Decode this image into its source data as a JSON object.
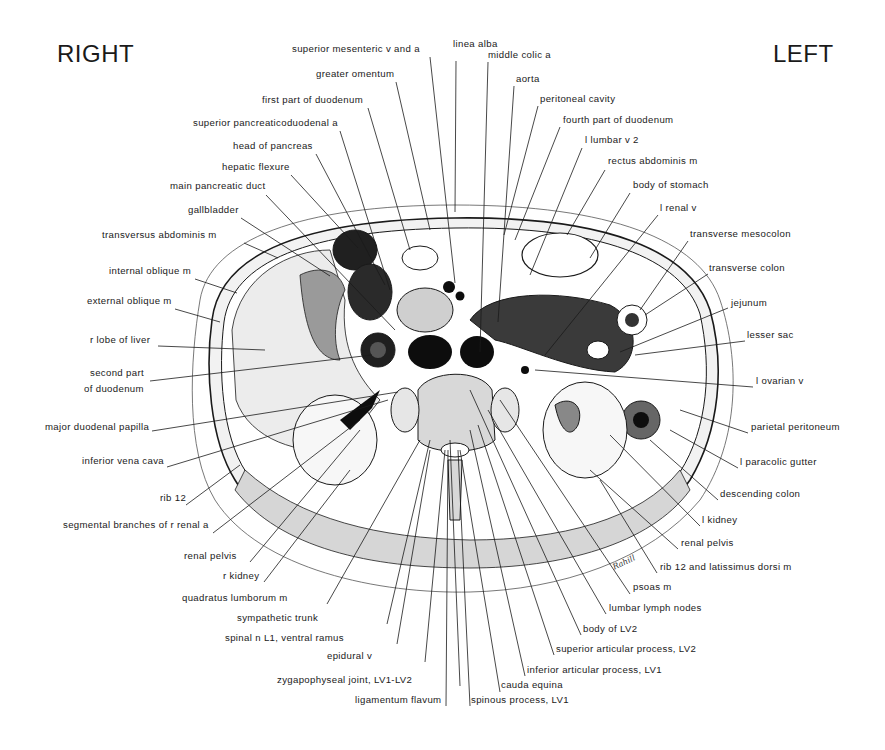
{
  "orientation": {
    "right": "RIGHT",
    "left": "LEFT"
  },
  "signature": "Rahill",
  "labels": {
    "top": [
      {
        "id": "superior-mesenteric-v-and-a",
        "text": "superior mesenteric v and a",
        "x": 292,
        "y": 51
      },
      {
        "id": "greater-omentum",
        "text": "greater omentum",
        "x": 316,
        "y": 76
      },
      {
        "id": "first-part-of-duodenum",
        "text": "first part of duodenum",
        "x": 262,
        "y": 102
      },
      {
        "id": "superior-pancreaticoduodenal-a",
        "text": "superior pancreaticoduodenal a",
        "x": 193,
        "y": 125
      },
      {
        "id": "head-of-pancreas",
        "text": "head of pancreas",
        "x": 233,
        "y": 148
      },
      {
        "id": "hepatic-flexure",
        "text": "hepatic flexure",
        "x": 222,
        "y": 169
      },
      {
        "id": "main-pancreatic-duct",
        "text": "main pancreatic duct",
        "x": 170,
        "y": 188
      },
      {
        "id": "gallbladder",
        "text": "gallbladder",
        "x": 188,
        "y": 212
      },
      {
        "id": "linea-alba",
        "text": "linea alba",
        "x": 453,
        "y": 46
      },
      {
        "id": "middle-colic-a",
        "text": "middle colic a",
        "x": 488,
        "y": 57
      },
      {
        "id": "aorta",
        "text": "aorta",
        "x": 516,
        "y": 81
      },
      {
        "id": "peritoneal-cavity",
        "text": "peritoneal cavity",
        "x": 540,
        "y": 101
      },
      {
        "id": "fourth-part-of-duodenum",
        "text": "fourth part of duodenum",
        "x": 563,
        "y": 122
      },
      {
        "id": "l-lumbar-v-2",
        "text": "l lumbar v 2",
        "x": 585,
        "y": 142
      },
      {
        "id": "rectus-abdominis-m",
        "text": "rectus abdominis m",
        "x": 608,
        "y": 163
      },
      {
        "id": "body-of-stomach",
        "text": "body of stomach",
        "x": 633,
        "y": 187
      },
      {
        "id": "l-renal-v",
        "text": "l renal v",
        "x": 660,
        "y": 210
      }
    ],
    "left_side": [
      {
        "id": "transversus-abdominis-m",
        "text": "transversus abdominis m",
        "x": 102,
        "y": 237
      },
      {
        "id": "internal-oblique-m",
        "text": "internal oblique m",
        "x": 109,
        "y": 273
      },
      {
        "id": "external-oblique-m",
        "text": "external oblique m",
        "x": 87,
        "y": 303
      },
      {
        "id": "r-lobe-of-liver",
        "text": "r lobe of liver",
        "x": 90,
        "y": 342
      },
      {
        "id": "second-part-of-duodenum-1",
        "text": "second part",
        "x": 90,
        "y": 375
      },
      {
        "id": "second-part-of-duodenum-2",
        "text": "of duodenum",
        "x": 84,
        "y": 391
      },
      {
        "id": "major-duodenal-papilla",
        "text": "major duodenal papilla",
        "x": 45,
        "y": 429
      },
      {
        "id": "inferior-vena-cava",
        "text": "inferior vena cava",
        "x": 82,
        "y": 463
      },
      {
        "id": "rib-12",
        "text": "rib 12",
        "x": 160,
        "y": 500
      },
      {
        "id": "segmental-branches-of-r-renal-a",
        "text": "segmental branches of r renal a",
        "x": 63,
        "y": 527
      }
    ],
    "right_side": [
      {
        "id": "transverse-mesocolon",
        "text": "transverse mesocolon",
        "x": 690,
        "y": 236
      },
      {
        "id": "transverse-colon",
        "text": "transverse colon",
        "x": 709,
        "y": 270
      },
      {
        "id": "jejunum",
        "text": "jejunum",
        "x": 731,
        "y": 305
      },
      {
        "id": "lesser-sac",
        "text": "lesser sac",
        "x": 747,
        "y": 337
      },
      {
        "id": "l-ovarian-v",
        "text": "l ovarian v",
        "x": 756,
        "y": 383
      },
      {
        "id": "parietal-peritoneum",
        "text": "parietal peritoneum",
        "x": 751,
        "y": 429
      },
      {
        "id": "l-paracolic-gutter",
        "text": "l paracolic gutter",
        "x": 740,
        "y": 464
      },
      {
        "id": "descending-colon",
        "text": "descending colon",
        "x": 720,
        "y": 496
      },
      {
        "id": "l-kidney",
        "text": "l kidney",
        "x": 702,
        "y": 522
      }
    ],
    "bottom": [
      {
        "id": "renal-pelvis-r",
        "text": "renal pelvis",
        "x": 184,
        "y": 558
      },
      {
        "id": "r-kidney",
        "text": "r kidney",
        "x": 223,
        "y": 578
      },
      {
        "id": "quadratus-lumborum-m",
        "text": "quadratus lumborum m",
        "x": 182,
        "y": 600
      },
      {
        "id": "sympathetic-trunk",
        "text": "sympathetic trunk",
        "x": 237,
        "y": 620
      },
      {
        "id": "spinal-n-l1-ventral-ramus",
        "text": "spinal n L1, ventral ramus",
        "x": 225,
        "y": 640
      },
      {
        "id": "epidural-v",
        "text": "epidural v",
        "x": 327,
        "y": 658
      },
      {
        "id": "zygapophyseal-joint",
        "text": "zygapophyseal joint, LV1-LV2",
        "x": 277,
        "y": 682
      },
      {
        "id": "ligamentum-flavum",
        "text": "ligamentum flavum",
        "x": 355,
        "y": 702
      },
      {
        "id": "spinous-process-lv1",
        "text": "spinous process, LV1",
        "x": 471,
        "y": 702
      },
      {
        "id": "cauda-equina",
        "text": "cauda equina",
        "x": 501,
        "y": 687
      },
      {
        "id": "inferior-articular-process-lv1",
        "text": "inferior articular process, LV1",
        "x": 527,
        "y": 672
      },
      {
        "id": "superior-articular-process-lv2",
        "text": "superior articular process, LV2",
        "x": 556,
        "y": 651
      },
      {
        "id": "body-of-lv2",
        "text": "body of LV2",
        "x": 583,
        "y": 631
      },
      {
        "id": "lumbar-lymph-nodes",
        "text": "lumbar lymph nodes",
        "x": 609,
        "y": 610
      },
      {
        "id": "psoas-m",
        "text": "psoas m",
        "x": 633,
        "y": 589
      },
      {
        "id": "rib-12-and-latissimus-dorsi-m",
        "text": "rib 12 and latissimus dorsi m",
        "x": 660,
        "y": 569
      },
      {
        "id": "renal-pelvis-l",
        "text": "renal pelvis",
        "x": 681,
        "y": 545
      }
    ]
  },
  "leaders": [
    [
      430,
      57,
      455,
      283
    ],
    [
      396,
      82,
      430,
      230
    ],
    [
      368,
      108,
      410,
      250
    ],
    [
      340,
      131,
      390,
      290
    ],
    [
      316,
      154,
      385,
      285
    ],
    [
      291,
      175,
      358,
      248
    ],
    [
      266,
      195,
      395,
      330
    ],
    [
      241,
      218,
      330,
      276
    ],
    [
      244,
      243,
      278,
      258
    ],
    [
      195,
      279,
      237,
      293
    ],
    [
      175,
      309,
      220,
      322
    ],
    [
      158,
      346,
      265,
      350
    ],
    [
      150,
      381,
      372,
      355
    ],
    [
      152,
      431,
      398,
      392
    ],
    [
      167,
      467,
      388,
      400
    ],
    [
      186,
      505,
      240,
      465
    ],
    [
      213,
      533,
      360,
      420
    ],
    [
      456,
      61,
      455,
      212
    ],
    [
      488,
      62,
      480,
      352
    ],
    [
      514,
      86,
      498,
      322
    ],
    [
      538,
      106,
      504,
      235
    ],
    [
      560,
      127,
      515,
      240
    ],
    [
      582,
      148,
      530,
      275
    ],
    [
      605,
      170,
      567,
      235
    ],
    [
      630,
      193,
      590,
      258
    ],
    [
      658,
      215,
      545,
      355
    ],
    [
      688,
      241,
      640,
      310
    ],
    [
      708,
      274,
      645,
      315
    ],
    [
      728,
      308,
      620,
      352
    ],
    [
      745,
      341,
      635,
      355
    ],
    [
      753,
      387,
      535,
      370
    ],
    [
      748,
      433,
      680,
      410
    ],
    [
      738,
      468,
      670,
      430
    ],
    [
      718,
      500,
      650,
      440
    ],
    [
      700,
      526,
      610,
      435
    ],
    [
      250,
      562,
      360,
      430
    ],
    [
      264,
      582,
      350,
      470
    ],
    [
      327,
      604,
      420,
      440
    ],
    [
      387,
      624,
      430,
      440
    ],
    [
      397,
      644,
      430,
      450
    ],
    [
      425,
      662,
      445,
      450
    ],
    [
      460,
      686,
      450,
      440
    ],
    [
      446,
      706,
      448,
      450
    ],
    [
      470,
      706,
      458,
      450
    ],
    [
      500,
      692,
      460,
      450
    ],
    [
      525,
      676,
      470,
      430
    ],
    [
      554,
      655,
      478,
      425
    ],
    [
      581,
      635,
      470,
      390
    ],
    [
      606,
      614,
      488,
      410
    ],
    [
      630,
      594,
      500,
      400
    ],
    [
      657,
      573,
      600,
      480
    ],
    [
      678,
      549,
      590,
      470
    ]
  ],
  "colors": {
    "ink": "#1a1a1a",
    "background": "#ffffff",
    "fill_dark": "#0d0d0d"
  }
}
